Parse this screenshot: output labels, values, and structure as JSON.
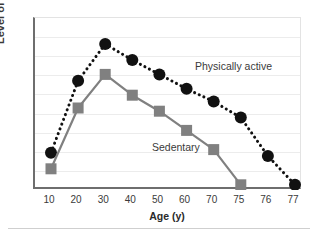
{
  "chart_data": {
    "type": "line",
    "title": "",
    "xlabel": "Age (y)",
    "ylabel": "Level of function",
    "grid": true,
    "legend_position": "inline-annotation",
    "x_categories": [
      "10",
      "20",
      "30",
      "40",
      "50",
      "60",
      "70",
      "75",
      "76",
      "77"
    ],
    "xlim": [
      0,
      9
    ],
    "ylim": [
      0,
      100
    ],
    "y_tick_labels": [],
    "gridline_count": 8,
    "series": [
      {
        "name": "Physically active",
        "marker": "circle",
        "color": "#111111",
        "line_style": "dotted",
        "x": [
          "10",
          "20",
          "30",
          "40",
          "50",
          "60",
          "70",
          "75",
          "76",
          "77"
        ],
        "values": [
          22,
          67,
          90,
          80,
          71,
          62,
          54,
          44,
          20,
          2
        ]
      },
      {
        "name": "Sedentary",
        "marker": "square",
        "color": "#808080",
        "line_style": "solid",
        "x": [
          "10",
          "20",
          "30",
          "40",
          "50",
          "60",
          "70",
          "75"
        ],
        "values": [
          12,
          50,
          71,
          58,
          48,
          36,
          24,
          2
        ]
      }
    ],
    "annotations": [
      {
        "text": "Physically active",
        "x": 160,
        "y": 42
      },
      {
        "text": "Sedentary",
        "x": 117,
        "y": 123
      }
    ]
  },
  "axis": {
    "x_title": "Age (y)",
    "y_title": "Level of function"
  }
}
